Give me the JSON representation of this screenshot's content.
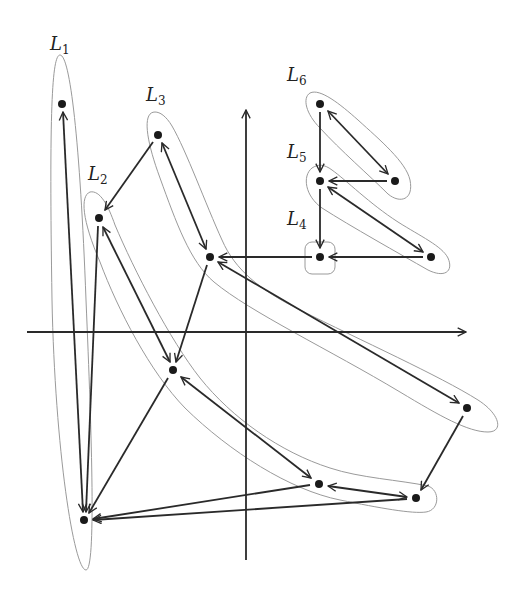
{
  "diagram": {
    "type": "layered-graph-with-levels",
    "colors": {
      "ink": "#2a2a2a",
      "region_outline": "#9a9a9a",
      "background": "#ffffff"
    },
    "axes": {
      "vertical": {
        "x": 246,
        "y1": 560,
        "y2": 108,
        "arrow": "up"
      },
      "horizontal": {
        "y": 332,
        "x1": 27,
        "x2": 468,
        "arrow": "right"
      }
    },
    "levels": [
      {
        "id": "L1",
        "letter": "L",
        "subscript": "1",
        "label_pos": [
          44,
          52
        ],
        "nodes": [
          "A",
          "B"
        ]
      },
      {
        "id": "L2",
        "letter": "L",
        "subscript": "2",
        "label_pos": [
          88,
          180
        ],
        "nodes": [
          "C",
          "D",
          "E",
          "F"
        ]
      },
      {
        "id": "L3",
        "letter": "L",
        "subscript": "3",
        "label_pos": [
          146,
          104
        ],
        "nodes": [
          "G",
          "H",
          "I"
        ]
      },
      {
        "id": "L4",
        "letter": "L",
        "subscript": "4",
        "label_pos": [
          286,
          225
        ],
        "nodes": [
          "J"
        ]
      },
      {
        "id": "L5",
        "letter": "L",
        "subscript": "5",
        "label_pos": [
          286,
          159
        ],
        "nodes": [
          "K",
          "L"
        ]
      },
      {
        "id": "L6",
        "letter": "L",
        "subscript": "6",
        "label_pos": [
          286,
          80
        ],
        "nodes": [
          "M",
          "N"
        ]
      }
    ],
    "nodes": [
      {
        "id": "A",
        "x": 62,
        "y": 104
      },
      {
        "id": "B",
        "x": 84,
        "y": 520
      },
      {
        "id": "C",
        "x": 99,
        "y": 218
      },
      {
        "id": "D",
        "x": 173,
        "y": 370
      },
      {
        "id": "E",
        "x": 319,
        "y": 484
      },
      {
        "id": "F",
        "x": 416,
        "y": 498
      },
      {
        "id": "G",
        "x": 158,
        "y": 135
      },
      {
        "id": "H",
        "x": 210,
        "y": 257
      },
      {
        "id": "I",
        "x": 467,
        "y": 408
      },
      {
        "id": "J",
        "x": 320,
        "y": 257
      },
      {
        "id": "K",
        "x": 320,
        "y": 181
      },
      {
        "id": "L",
        "x": 431,
        "y": 257
      },
      {
        "id": "M",
        "x": 320,
        "y": 104
      },
      {
        "id": "N",
        "x": 395,
        "y": 181
      }
    ],
    "edges": [
      {
        "from": "B",
        "to": "A",
        "bidirectional": true
      },
      {
        "from": "C",
        "to": "B",
        "bidirectional": false
      },
      {
        "from": "D",
        "to": "B",
        "bidirectional": false
      },
      {
        "from": "E",
        "to": "B",
        "bidirectional": false
      },
      {
        "from": "F",
        "to": "B",
        "bidirectional": false
      },
      {
        "from": "D",
        "to": "C",
        "bidirectional": true
      },
      {
        "from": "G",
        "to": "C",
        "bidirectional": false
      },
      {
        "from": "H",
        "to": "D",
        "bidirectional": false
      },
      {
        "from": "D",
        "to": "E",
        "bidirectional": true
      },
      {
        "from": "E",
        "to": "F",
        "bidirectional": true
      },
      {
        "from": "I",
        "to": "F",
        "bidirectional": false
      },
      {
        "from": "G",
        "to": "H",
        "bidirectional": true
      },
      {
        "from": "H",
        "to": "I",
        "bidirectional": true
      },
      {
        "from": "J",
        "to": "H",
        "bidirectional": false
      },
      {
        "from": "L",
        "to": "J",
        "bidirectional": false
      },
      {
        "from": "K",
        "to": "J",
        "bidirectional": false
      },
      {
        "from": "N",
        "to": "K",
        "bidirectional": false
      },
      {
        "from": "K",
        "to": "L",
        "bidirectional": true
      },
      {
        "from": "M",
        "to": "K",
        "bidirectional": false
      },
      {
        "from": "M",
        "to": "N",
        "bidirectional": true
      }
    ]
  }
}
